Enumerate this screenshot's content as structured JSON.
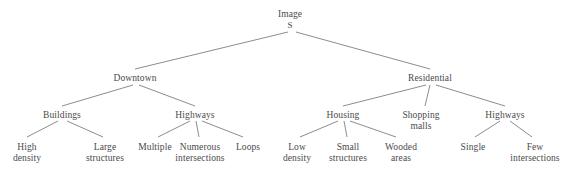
{
  "diagram": {
    "type": "tree",
    "orientation": "top-down",
    "background_color": "#ffffff",
    "text_color": "#4a4a4a",
    "edge_color": "#6e6e6e",
    "nodes": [
      {
        "id": "root",
        "label": "Image",
        "sublabel": "S",
        "x": 290,
        "y": 9,
        "level": 0
      },
      {
        "id": "downtown",
        "label": "Downtown",
        "sublabel": "",
        "x": 135,
        "y": 73,
        "level": 1
      },
      {
        "id": "residential",
        "label": "Residential",
        "sublabel": "",
        "x": 430,
        "y": 73,
        "level": 1
      },
      {
        "id": "buildings",
        "label": "Buildings",
        "sublabel": "",
        "x": 62,
        "y": 110,
        "level": 2
      },
      {
        "id": "highways-dt",
        "label": "Highways",
        "sublabel": "",
        "x": 195,
        "y": 110,
        "level": 2
      },
      {
        "id": "housing",
        "label": "Housing",
        "sublabel": "",
        "x": 343,
        "y": 110,
        "level": 2
      },
      {
        "id": "shopping",
        "label": "Shopping\nmalls",
        "sublabel": "",
        "x": 421,
        "y": 110,
        "level": 2
      },
      {
        "id": "highways-res",
        "label": "Highways",
        "sublabel": "",
        "x": 505,
        "y": 110,
        "level": 2
      },
      {
        "id": "high-density",
        "label": "High\ndensity",
        "sublabel": "",
        "x": 27,
        "y": 142,
        "level": 3
      },
      {
        "id": "large-struct",
        "label": "Large\nstructures",
        "sublabel": "",
        "x": 105,
        "y": 142,
        "level": 3
      },
      {
        "id": "multiple",
        "label": "Multiple",
        "sublabel": "",
        "x": 155,
        "y": 142,
        "level": 3
      },
      {
        "id": "numerous-int",
        "label": "Numerous\nintersections",
        "sublabel": "",
        "x": 200,
        "y": 142,
        "level": 3
      },
      {
        "id": "loops",
        "label": "Loops",
        "sublabel": "",
        "x": 248,
        "y": 142,
        "level": 3
      },
      {
        "id": "low-density",
        "label": "Low\ndensity",
        "sublabel": "",
        "x": 297,
        "y": 142,
        "level": 3
      },
      {
        "id": "small-struct",
        "label": "Small\nstructures",
        "sublabel": "",
        "x": 348,
        "y": 142,
        "level": 3
      },
      {
        "id": "wooded-areas",
        "label": "Wooded\nareas",
        "sublabel": "",
        "x": 401,
        "y": 142,
        "level": 3
      },
      {
        "id": "single",
        "label": "Single",
        "sublabel": "",
        "x": 473,
        "y": 142,
        "level": 3
      },
      {
        "id": "few-int",
        "label": "Few\nintersections",
        "sublabel": "",
        "x": 535,
        "y": 142,
        "level": 3
      }
    ],
    "edges": [
      {
        "from": "root",
        "to": "downtown",
        "x1": 288,
        "y1": 32,
        "x2": 135,
        "y2": 69
      },
      {
        "from": "root",
        "to": "residential",
        "x1": 296,
        "y1": 32,
        "x2": 430,
        "y2": 69
      },
      {
        "from": "downtown",
        "to": "buildings",
        "x1": 133,
        "y1": 85,
        "x2": 62,
        "y2": 106
      },
      {
        "from": "downtown",
        "to": "highways-dt",
        "x1": 139,
        "y1": 85,
        "x2": 195,
        "y2": 106
      },
      {
        "from": "residential",
        "to": "housing",
        "x1": 426,
        "y1": 85,
        "x2": 343,
        "y2": 106
      },
      {
        "from": "residential",
        "to": "shopping",
        "x1": 430,
        "y1": 85,
        "x2": 425,
        "y2": 106
      },
      {
        "from": "residential",
        "to": "highways-res",
        "x1": 436,
        "y1": 85,
        "x2": 505,
        "y2": 106
      },
      {
        "from": "buildings",
        "to": "high-density",
        "x1": 58,
        "y1": 121,
        "x2": 27,
        "y2": 137
      },
      {
        "from": "buildings",
        "to": "large-struct",
        "x1": 67,
        "y1": 121,
        "x2": 103,
        "y2": 137
      },
      {
        "from": "highways-dt",
        "to": "multiple",
        "x1": 190,
        "y1": 121,
        "x2": 158,
        "y2": 137
      },
      {
        "from": "highways-dt",
        "to": "numerous-int",
        "x1": 196,
        "y1": 121,
        "x2": 199,
        "y2": 137
      },
      {
        "from": "highways-dt",
        "to": "loops",
        "x1": 202,
        "y1": 121,
        "x2": 243,
        "y2": 137
      },
      {
        "from": "housing",
        "to": "low-density",
        "x1": 338,
        "y1": 121,
        "x2": 300,
        "y2": 137
      },
      {
        "from": "housing",
        "to": "small-struct",
        "x1": 344,
        "y1": 121,
        "x2": 347,
        "y2": 137
      },
      {
        "from": "housing",
        "to": "wooded-areas",
        "x1": 350,
        "y1": 121,
        "x2": 396,
        "y2": 137
      },
      {
        "from": "highways-res",
        "to": "single",
        "x1": 500,
        "y1": 121,
        "x2": 475,
        "y2": 137
      },
      {
        "from": "highways-res",
        "to": "few-int",
        "x1": 510,
        "y1": 121,
        "x2": 532,
        "y2": 137
      }
    ]
  }
}
